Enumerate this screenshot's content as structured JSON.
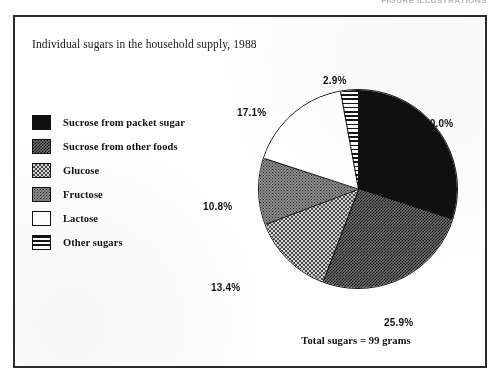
{
  "page": {
    "running_head": "FIGURE ILLUSTRATIONS"
  },
  "figure": {
    "title": "Individual sugars in the household supply, 1988",
    "total_note": "Total sugars = 99 grams"
  },
  "legend": {
    "items": [
      {
        "label": "Sucrose from packet sugar",
        "pattern": "solid-black",
        "swatch_name": "legend-swatch-sucrose-packet"
      },
      {
        "label": "Sucrose from other  foods",
        "pattern": "dark-check",
        "swatch_name": "legend-swatch-sucrose-other"
      },
      {
        "label": "Glucose",
        "pattern": "light-check",
        "swatch_name": "legend-swatch-glucose"
      },
      {
        "label": "Fructose",
        "pattern": "gray-stipple",
        "swatch_name": "legend-swatch-fructose"
      },
      {
        "label": "Lactose",
        "pattern": "white",
        "swatch_name": "legend-swatch-lactose"
      },
      {
        "label": "Other sugars",
        "pattern": "hstripe",
        "swatch_name": "legend-swatch-other-sugars"
      }
    ]
  },
  "chart_data": {
    "type": "pie",
    "title": "Individual sugars in the household supply, 1988",
    "subtitle": "",
    "annotations": [
      "Total sugars = 99 grams"
    ],
    "unit": "percent",
    "total_grams": 99,
    "start_angle_deg": 0,
    "direction": "clockwise",
    "legend_position": "left",
    "categories": [
      "Sucrose from packet sugar",
      "Sucrose from other  foods",
      "Glucose",
      "Fructose",
      "Lactose",
      "Other sugars"
    ],
    "values": [
      30.0,
      25.9,
      13.4,
      10.8,
      17.1,
      2.9
    ],
    "labels": [
      "30.0%",
      "25.9%",
      "13.4%",
      "10.8%",
      "17.1%",
      "2.9%"
    ],
    "slices": [
      {
        "name": "Sucrose from packet sugar",
        "value": 30.0,
        "label": "30.0%",
        "pattern": "solid-black",
        "label_left": 409,
        "label_top": 101
      },
      {
        "name": "Sucrose from other  foods",
        "value": 25.9,
        "label": "25.9%",
        "pattern": "dark-check",
        "label_left": 369,
        "label_top": 300
      },
      {
        "name": "Glucose",
        "value": 13.4,
        "label": "13.4%",
        "pattern": "light-check",
        "label_left": 196,
        "label_top": 265
      },
      {
        "name": "Fructose",
        "value": 10.8,
        "label": "10.8%",
        "pattern": "gray-stipple",
        "label_left": 188,
        "label_top": 184
      },
      {
        "name": "Lactose",
        "value": 17.1,
        "label": "17.1%",
        "pattern": "white",
        "label_left": 222,
        "label_top": 90
      },
      {
        "name": "Other sugars",
        "value": 2.9,
        "label": "2.9%",
        "pattern": "hstripe",
        "label_left": 308,
        "label_top": 58
      }
    ]
  }
}
